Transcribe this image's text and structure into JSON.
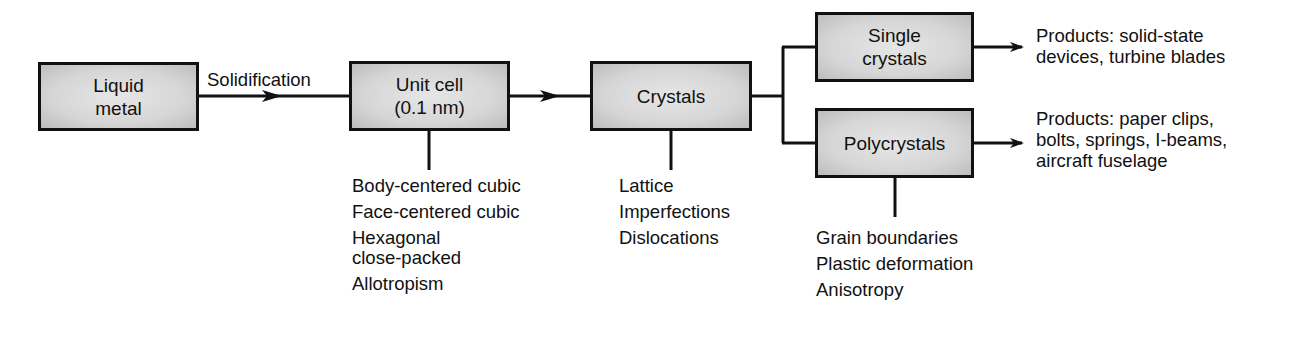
{
  "diagram": {
    "nodes": {
      "liquid_metal": "Liquid\nmetal",
      "unit_cell": "Unit cell\n(0.1 nm)",
      "crystals": "Crystals",
      "single_crystals": "Single\ncrystals",
      "polycrystals": "Polycrystals"
    },
    "edge_labels": {
      "solidification": "Solidification"
    },
    "unit_cell_properties": [
      "Body-centered cubic",
      "Face-centered cubic",
      "Hexagonal\nclose-packed",
      "Allotropism"
    ],
    "crystal_properties": [
      "Lattice",
      "Imperfections",
      "Dislocations"
    ],
    "polycrystal_properties": [
      "Grain  boundaries",
      "Plastic deformation",
      "Anisotropy"
    ],
    "products": {
      "single_crystals": "Products: solid-state\ndevices, turbine blades",
      "polycrystals": "Products: paper clips,\nbolts, springs, I-beams,\naircraft fuselage"
    },
    "colors": {
      "line": "#111111",
      "box_fill": "#d6d6d6",
      "background": "#ffffff"
    }
  }
}
